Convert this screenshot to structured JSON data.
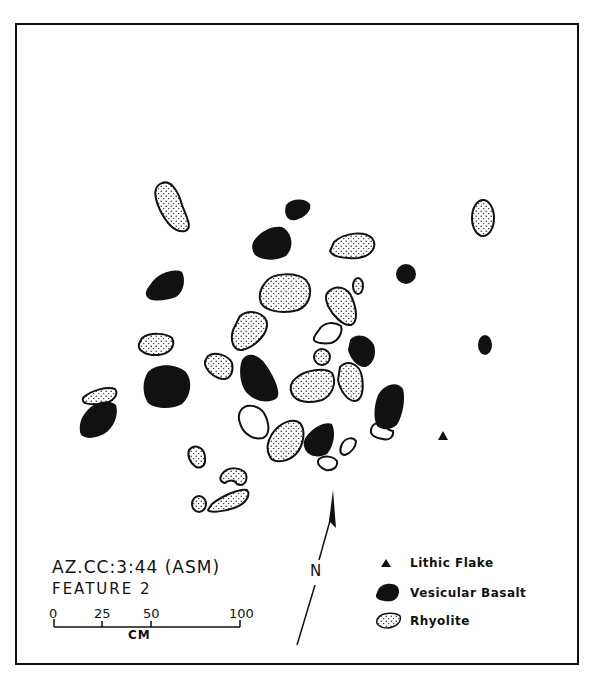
{
  "map": {
    "site_id": "AZ.CC:3:44 (ASM)",
    "feature": "FEATURE 2",
    "north_label": "N",
    "scale": {
      "unit": "CM",
      "ticks": [
        "0",
        "25",
        "50",
        "100"
      ]
    },
    "legend": [
      {
        "symbol": "triangle",
        "label": "Lithic Flake"
      },
      {
        "symbol": "solid",
        "label": "Vesicular Basalt"
      },
      {
        "symbol": "stipple",
        "label": "Rhyolite"
      }
    ],
    "colors": {
      "ink": "#111111",
      "paper": "#ffffff"
    }
  }
}
